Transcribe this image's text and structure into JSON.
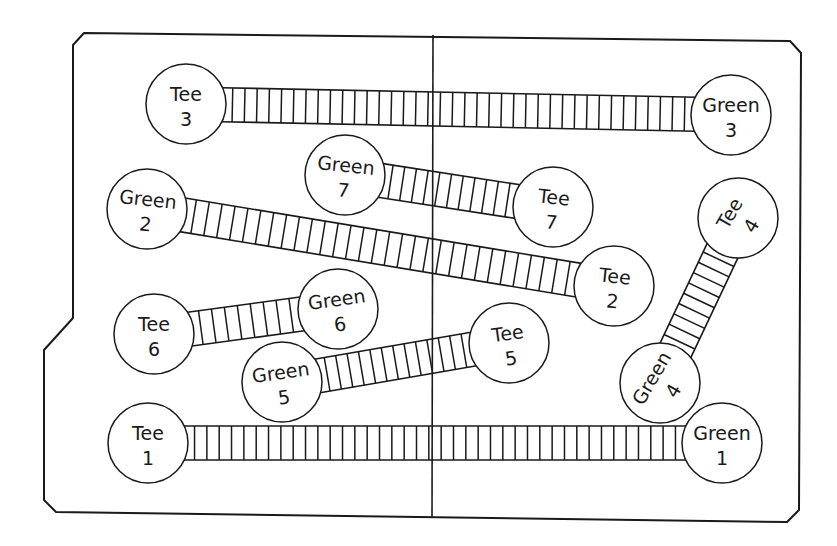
{
  "diagram": {
    "type": "miniature golf course layout",
    "colors": {
      "ink": "#1a1a1a",
      "background": "#ffffff"
    },
    "board": {
      "outline": [
        [
          84,
          33
        ],
        [
          790,
          41
        ],
        [
          801,
          53
        ],
        [
          799,
          510
        ],
        [
          787,
          522
        ],
        [
          56,
          512
        ],
        [
          44,
          500
        ],
        [
          44,
          350
        ],
        [
          73,
          318
        ],
        [
          73,
          45
        ]
      ],
      "divider": {
        "x1": 433,
        "y1": 35,
        "x2": 432,
        "y2": 518
      }
    },
    "holes": [
      {
        "hole": 1,
        "tee": {
          "label": "Tee",
          "number": "1",
          "cx": 148,
          "cy": 443,
          "r": 40,
          "rotate": 0
        },
        "green": {
          "label": "Green",
          "number": "1",
          "cx": 722,
          "cy": 443,
          "r": 40,
          "rotate": 0
        },
        "width": 34,
        "rungs": 40
      },
      {
        "hole": 2,
        "tee": {
          "label": "Tee",
          "number": "2",
          "cx": 614,
          "cy": 286,
          "r": 40,
          "rotate": 6
        },
        "green": {
          "label": "Green",
          "number": "2",
          "cx": 147,
          "cy": 209,
          "r": 40,
          "rotate": 6
        },
        "width": 34,
        "rungs": 30
      },
      {
        "hole": 3,
        "tee": {
          "label": "Tee",
          "number": "3",
          "cx": 186,
          "cy": 104,
          "r": 40,
          "rotate": 0
        },
        "green": {
          "label": "Green",
          "number": "3",
          "cx": 731,
          "cy": 115,
          "r": 40,
          "rotate": 0
        },
        "width": 34,
        "rungs": 38
      },
      {
        "hole": 4,
        "tee": {
          "label": "Tee",
          "number": "4",
          "cx": 738,
          "cy": 218,
          "r": 40,
          "rotate": -60
        },
        "green": {
          "label": "Green",
          "number": "4",
          "cx": 660,
          "cy": 383,
          "r": 40,
          "rotate": -60
        },
        "width": 34,
        "rungs": 9
      },
      {
        "hole": 5,
        "tee": {
          "label": "Tee",
          "number": "5",
          "cx": 509,
          "cy": 343,
          "r": 40,
          "rotate": -8
        },
        "green": {
          "label": "Green",
          "number": "5",
          "cx": 282,
          "cy": 382,
          "r": 40,
          "rotate": -8
        },
        "width": 34,
        "rungs": 13
      },
      {
        "hole": 6,
        "tee": {
          "label": "Tee",
          "number": "6",
          "cx": 154,
          "cy": 334,
          "r": 40,
          "rotate": 0
        },
        "green": {
          "label": "Green",
          "number": "6",
          "cx": 338,
          "cy": 309,
          "r": 40,
          "rotate": -8
        },
        "width": 34,
        "rungs": 8
      },
      {
        "hole": 7,
        "tee": {
          "label": "Tee",
          "number": "7",
          "cx": 553,
          "cy": 207,
          "r": 40,
          "rotate": 6
        },
        "green": {
          "label": "Green",
          "number": "7",
          "cx": 345,
          "cy": 175,
          "r": 40,
          "rotate": 6
        },
        "width": 34,
        "rungs": 11
      }
    ]
  },
  "a11y": {
    "title": "Golf course board with seven holes, each linking a tee to a green"
  }
}
